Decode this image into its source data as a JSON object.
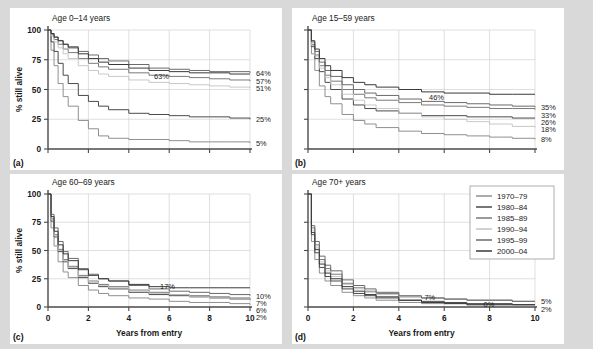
{
  "figure": {
    "background": "#d9d9d9",
    "panel_background": "#ffffff",
    "xlabel": "Years from entry",
    "ylabel": "% still alive",
    "xticks": [
      "0",
      "2",
      "4",
      "6",
      "8",
      "10"
    ],
    "yticks": [
      "0",
      "25",
      "50",
      "75",
      "100"
    ],
    "xlim": [
      0,
      10
    ],
    "ylim": [
      0,
      100
    ]
  },
  "legend": {
    "position": "panel-d-top-right",
    "entries": [
      {
        "label": "1970–79",
        "color": "#8f8f8f"
      },
      {
        "label": "1980–84",
        "color": "#4a4a4a"
      },
      {
        "label": "1985–89",
        "color": "#7a7a7a"
      },
      {
        "label": "1990–94",
        "color": "#c2c2c2"
      },
      {
        "label": "1995–99",
        "color": "#6b6b6b"
      },
      {
        "label": "2000–04",
        "color": "#3a3a3a"
      }
    ]
  },
  "chart_data": [
    {
      "type": "line",
      "panel": "a",
      "panel_letter": "(a)",
      "title": "Age 0–14 years",
      "xlabel": "",
      "ylabel": "% still alive",
      "xlim": [
        0,
        10
      ],
      "ylim": [
        0,
        100
      ],
      "grid": true,
      "annotations": [
        {
          "text": "63%",
          "x": 5.1,
          "y": 61
        }
      ],
      "end_labels": [
        "64%",
        "57%",
        "51%",
        "25%",
        "5%"
      ],
      "x": [
        0,
        0.15,
        0.3,
        0.5,
        0.75,
        1,
        1.5,
        2,
        2.5,
        3,
        4,
        5,
        6,
        7,
        8,
        9,
        10
      ],
      "series": [
        {
          "name": "1970–79",
          "color": "#8f8f8f",
          "end_value": 5,
          "values": [
            100,
            83,
            70,
            55,
            44,
            36,
            24,
            17,
            11,
            9,
            8,
            8,
            7,
            6,
            6,
            6,
            5
          ]
        },
        {
          "name": "1980–84",
          "color": "#4a4a4a",
          "end_value": 25,
          "values": [
            100,
            90,
            82,
            72,
            62,
            55,
            45,
            40,
            36,
            33,
            30,
            29,
            28,
            27,
            27,
            26,
            25
          ]
        },
        {
          "name": "1985–89",
          "color": "#7a7a7a",
          "end_value": 57,
          "values": [
            100,
            96,
            92,
            88,
            84,
            81,
            76,
            72,
            69,
            67,
            64,
            62,
            61,
            60,
            59,
            58,
            57
          ]
        },
        {
          "name": "1990–94",
          "color": "#c2c2c2",
          "end_value": 51,
          "values": [
            100,
            95,
            90,
            85,
            80,
            76,
            70,
            66,
            63,
            61,
            58,
            56,
            55,
            54,
            53,
            52,
            51
          ]
        },
        {
          "name": "1995–99",
          "color": "#6b6b6b",
          "end_value": 64,
          "values": [
            100,
            97,
            94,
            91,
            88,
            86,
            82,
            79,
            76,
            74,
            71,
            68,
            67,
            66,
            65,
            65,
            64
          ]
        },
        {
          "name": "2000–04",
          "color": "#3a3a3a",
          "end_value": 63,
          "values": [
            100,
            97,
            94,
            91,
            88,
            85,
            80,
            76,
            73,
            71,
            68,
            66,
            65,
            64,
            64,
            63,
            63
          ]
        }
      ]
    },
    {
      "type": "line",
      "panel": "b",
      "panel_letter": "(b)",
      "title": "Age 15–59 years",
      "xlabel": "",
      "ylabel": "",
      "xlim": [
        0,
        10
      ],
      "ylim": [
        0,
        100
      ],
      "grid": true,
      "annotations": [
        {
          "text": "46%",
          "x": 5.2,
          "y": 44
        }
      ],
      "end_labels": [
        "35%",
        "33%",
        "26%",
        "18%",
        "8%"
      ],
      "x": [
        0,
        0.15,
        0.3,
        0.5,
        0.75,
        1,
        1.5,
        2,
        2.5,
        3,
        4,
        5,
        6,
        7,
        8,
        9,
        10
      ],
      "series": [
        {
          "name": "1970–79",
          "color": "#8f8f8f",
          "end_value": 8,
          "values": [
            100,
            80,
            66,
            53,
            44,
            38,
            29,
            24,
            21,
            18,
            15,
            13,
            12,
            11,
            10,
            9,
            8
          ]
        },
        {
          "name": "1980–84",
          "color": "#4a4a4a",
          "end_value": 26,
          "values": [
            100,
            86,
            76,
            65,
            56,
            50,
            42,
            37,
            34,
            32,
            30,
            28,
            28,
            27,
            27,
            26,
            26
          ]
        },
        {
          "name": "1985–89",
          "color": "#7a7a7a",
          "end_value": 33,
          "values": [
            100,
            88,
            79,
            70,
            62,
            57,
            50,
            46,
            43,
            41,
            39,
            37,
            36,
            35,
            34,
            34,
            33
          ]
        },
        {
          "name": "1990–94",
          "color": "#c2c2c2",
          "end_value": 18,
          "values": [
            100,
            87,
            78,
            68,
            60,
            54,
            46,
            41,
            37,
            34,
            30,
            27,
            25,
            23,
            21,
            19,
            18
          ]
        },
        {
          "name": "1995–99",
          "color": "#6b6b6b",
          "end_value": 35,
          "values": [
            100,
            90,
            82,
            73,
            66,
            61,
            54,
            50,
            47,
            45,
            42,
            40,
            39,
            38,
            37,
            36,
            35
          ]
        },
        {
          "name": "2000–04",
          "color": "#3a3a3a",
          "end_value": 46,
          "values": [
            100,
            91,
            84,
            76,
            70,
            66,
            60,
            56,
            54,
            52,
            50,
            48,
            47,
            47,
            46,
            46,
            46
          ]
        }
      ]
    },
    {
      "type": "line",
      "panel": "c",
      "panel_letter": "(c)",
      "title": "Age 60–69 years",
      "xlabel": "Years from entry",
      "ylabel": "% still alive",
      "xlim": [
        0,
        10
      ],
      "ylim": [
        0,
        100
      ],
      "grid": true,
      "annotations": [
        {
          "text": "17%",
          "x": 5.4,
          "y": 19
        }
      ],
      "end_labels": [
        "10%",
        "7%",
        "6%",
        "2%"
      ],
      "x": [
        0,
        0.15,
        0.3,
        0.5,
        0.75,
        1,
        1.5,
        2,
        2.5,
        3,
        4,
        5,
        6,
        7,
        8,
        9,
        10
      ],
      "series": [
        {
          "name": "1970–79",
          "color": "#8f8f8f",
          "end_value": 2,
          "values": [
            100,
            70,
            54,
            40,
            31,
            26,
            19,
            15,
            12,
            10,
            8,
            7,
            5,
            4,
            4,
            3,
            2
          ]
        },
        {
          "name": "1980–84",
          "color": "#4a4a4a",
          "end_value": 6,
          "values": [
            100,
            76,
            62,
            49,
            40,
            34,
            26,
            21,
            18,
            16,
            13,
            11,
            10,
            9,
            8,
            7,
            6
          ]
        },
        {
          "name": "1985–89",
          "color": "#7a7a7a",
          "end_value": 7,
          "values": [
            100,
            78,
            64,
            51,
            42,
            36,
            28,
            23,
            20,
            18,
            15,
            13,
            11,
            10,
            9,
            8,
            7
          ]
        },
        {
          "name": "1990–94",
          "color": "#c2c2c2",
          "end_value": 6,
          "values": [
            100,
            77,
            63,
            50,
            41,
            35,
            27,
            22,
            19,
            17,
            14,
            12,
            11,
            9,
            8,
            7,
            6
          ]
        },
        {
          "name": "1995–99",
          "color": "#6b6b6b",
          "end_value": 10,
          "values": [
            100,
            82,
            70,
            58,
            49,
            43,
            34,
            29,
            25,
            23,
            19,
            16,
            14,
            13,
            12,
            11,
            10
          ]
        },
        {
          "name": "2000–04",
          "color": "#3a3a3a",
          "end_value": 17,
          "values": [
            100,
            80,
            67,
            55,
            47,
            41,
            33,
            28,
            25,
            23,
            20,
            18,
            17,
            17,
            17,
            17,
            17
          ]
        }
      ]
    },
    {
      "type": "line",
      "panel": "d",
      "panel_letter": "(d)",
      "title": "Age 70+ years",
      "xlabel": "Years from entry",
      "ylabel": "",
      "xlim": [
        0,
        10
      ],
      "ylim": [
        0,
        100
      ],
      "grid": true,
      "annotations": [
        {
          "text": "7%",
          "x": 5.0,
          "y": 9
        },
        {
          "text": "0%",
          "x": 7.6,
          "y": 3
        }
      ],
      "end_labels": [
        "5%",
        "2%"
      ],
      "x": [
        0,
        0.15,
        0.3,
        0.5,
        0.75,
        1,
        1.5,
        2,
        2.5,
        3,
        4,
        5,
        6,
        7,
        8,
        9,
        10
      ],
      "series": [
        {
          "name": "1970–79",
          "color": "#8f8f8f",
          "end_value": 2,
          "values": [
            100,
            58,
            42,
            30,
            23,
            19,
            13,
            10,
            8,
            6,
            4,
            3,
            3,
            2,
            2,
            2,
            2
          ]
        },
        {
          "name": "1980–84",
          "color": "#4a4a4a",
          "end_value": 2,
          "values": [
            100,
            64,
            48,
            35,
            27,
            23,
            16,
            12,
            10,
            8,
            6,
            5,
            4,
            3,
            3,
            2,
            2
          ]
        },
        {
          "name": "1985–89",
          "color": "#7a7a7a",
          "end_value": 5,
          "values": [
            100,
            70,
            55,
            42,
            34,
            29,
            21,
            17,
            14,
            12,
            9,
            8,
            7,
            6,
            6,
            5,
            5
          ]
        },
        {
          "name": "1990–94",
          "color": "#c2c2c2",
          "end_value": 5,
          "values": [
            100,
            68,
            53,
            40,
            32,
            27,
            20,
            16,
            13,
            11,
            9,
            8,
            7,
            6,
            6,
            5,
            5
          ]
        },
        {
          "name": "1995–99",
          "color": "#6b6b6b",
          "end_value": 5,
          "values": [
            100,
            72,
            58,
            45,
            37,
            32,
            24,
            19,
            16,
            13,
            10,
            8,
            7,
            6,
            6,
            5,
            5
          ]
        },
        {
          "name": "2000–04",
          "color": "#3a3a3a",
          "end_value": 0,
          "values": [
            100,
            66,
            51,
            38,
            30,
            25,
            18,
            14,
            11,
            9,
            6,
            4,
            3,
            2,
            2,
            2,
            2
          ]
        }
      ]
    }
  ]
}
